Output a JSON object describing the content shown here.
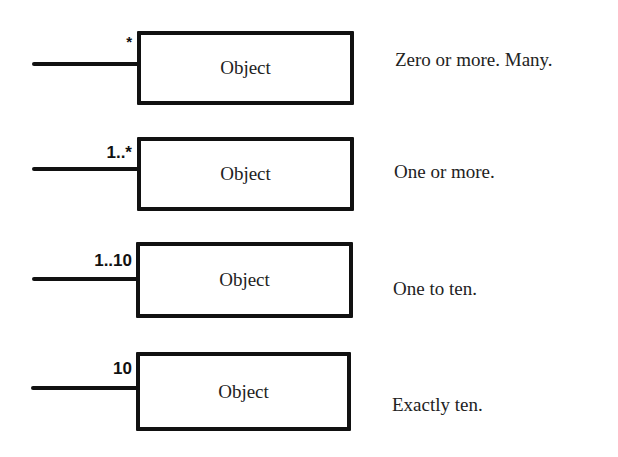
{
  "diagram": {
    "rows": [
      {
        "multiplicity": "*",
        "object_label": "Object",
        "description": "Zero or more. Many."
      },
      {
        "multiplicity": "1..*",
        "object_label": "Object",
        "description": "One or more."
      },
      {
        "multiplicity": "1..10",
        "object_label": "Object",
        "description": "One to ten."
      },
      {
        "multiplicity": "10",
        "object_label": "Object",
        "description": "Exactly ten."
      }
    ]
  }
}
